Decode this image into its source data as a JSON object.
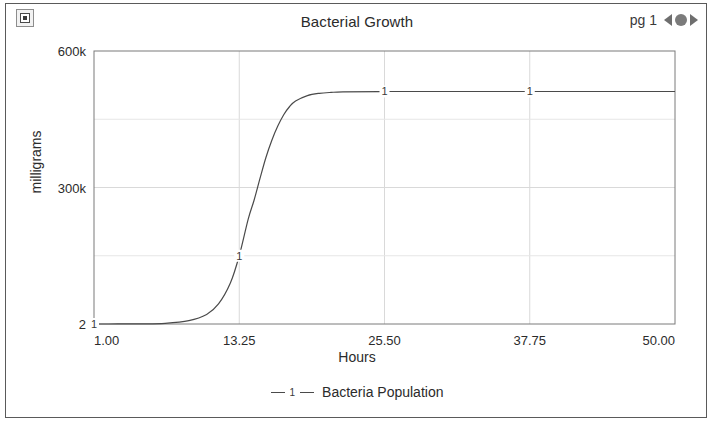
{
  "header": {
    "icon_name": "report-icon",
    "title": "Bacterial Growth",
    "page_label": "pg 1",
    "prev_icon": "prev-arrow-icon",
    "pager_dot_icon": "pager-dot-icon",
    "next_icon": "next-arrow-icon"
  },
  "chart_data": {
    "type": "line",
    "title": "Bacterial Growth",
    "xlabel": "Hours",
    "ylabel": "milligrams",
    "xlim": [
      1.0,
      50.0
    ],
    "ylim": [
      2,
      600000
    ],
    "xticks": [
      "1.00",
      "13.25",
      "25.50",
      "37.75",
      "50.00"
    ],
    "xtick_values": [
      1.0,
      13.25,
      25.5,
      37.75,
      50.0
    ],
    "yticks": [
      "2",
      "300k",
      "600k"
    ],
    "ytick_values": [
      2,
      300000,
      600000
    ],
    "grid": true,
    "legend_position": "bottom",
    "series": [
      {
        "name": "Bacteria Population",
        "marker_label": "1",
        "color": "#4a4a4a",
        "x": [
          1.0,
          3.0,
          5.0,
          7.0,
          9.0,
          10.5,
          11.5,
          12.5,
          13.25,
          14.0,
          14.5,
          15.0,
          15.5,
          16.0,
          16.5,
          17.0,
          17.5,
          18.0,
          19.0,
          20.0,
          21.0,
          22.0,
          25.5,
          30.0,
          35.0,
          37.75,
          42.0,
          46.0,
          50.0
        ],
        "y": [
          2,
          60,
          300,
          1500,
          7400,
          21000,
          44000,
          90000,
          150000,
          230000,
          272000,
          320000,
          366000,
          404000,
          435000,
          460000,
          478000,
          490000,
          502000,
          507000,
          509000,
          510000,
          511000,
          511000,
          511000,
          511000,
          511000,
          511000,
          511000
        ],
        "point_markers": [
          {
            "x": 1.0,
            "y": 2,
            "label": "1"
          },
          {
            "x": 13.25,
            "y": 150000,
            "label": "1"
          },
          {
            "x": 25.5,
            "y": 511000,
            "label": "1"
          },
          {
            "x": 37.75,
            "y": 511000,
            "label": "1"
          }
        ]
      }
    ]
  },
  "legend": {
    "marker_label": "1",
    "entry_label": "Bacteria Population"
  }
}
